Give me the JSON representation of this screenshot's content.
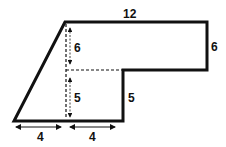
{
  "figure": {
    "type": "composite-shape",
    "labels": {
      "top": "12",
      "right_upper": "6",
      "inner_upper": "6",
      "inner_lower": "5",
      "step_right": "5",
      "bottom_left": "4",
      "bottom_right": "4"
    },
    "colors": {
      "stroke": "#111111",
      "background": "#ffffff"
    }
  }
}
